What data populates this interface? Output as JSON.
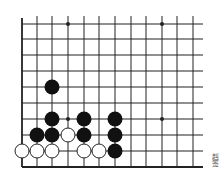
{
  "diagram": {
    "type": "go-board-fragment",
    "columns_x": [
      22,
      37,
      52,
      68,
      84,
      99,
      115,
      131,
      146,
      162,
      177,
      193
    ],
    "rows_y": [
      24,
      39,
      55,
      71,
      87,
      103,
      119,
      135,
      151,
      167
    ],
    "edges": {
      "left": true,
      "bottom": true,
      "top": false,
      "right": false
    },
    "star_points": [
      [
        3,
        0
      ],
      [
        9,
        0
      ],
      [
        3,
        6
      ],
      [
        9,
        6
      ]
    ],
    "black_stones": [
      [
        2,
        4
      ],
      [
        2,
        6
      ],
      [
        1,
        7
      ],
      [
        2,
        7
      ],
      [
        4,
        6
      ],
      [
        4,
        7
      ],
      [
        6,
        6
      ],
      [
        6,
        7
      ],
      [
        6,
        8
      ]
    ],
    "white_stones": [
      [
        0,
        8
      ],
      [
        1,
        8
      ],
      [
        2,
        8
      ],
      [
        3,
        7
      ],
      [
        4,
        8
      ],
      [
        5,
        8
      ]
    ],
    "stone_radius": 7,
    "colors": {
      "line": "#222222",
      "black": "#111111",
      "white": "#ffffff"
    }
  },
  "caption": "赳签"
}
